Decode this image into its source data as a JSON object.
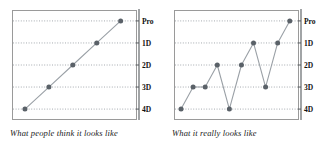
{
  "figure": {
    "panels": [
      {
        "id": "expected",
        "caption": "What people think it looks like",
        "chart_data": {
          "type": "line",
          "title": "What people think it looks like",
          "xlabel": "",
          "ylabel": "",
          "categories": [
            "1",
            "2",
            "3",
            "4",
            "5"
          ],
          "x": [
            1,
            2,
            3,
            4,
            5
          ],
          "values": [
            "4D",
            "3D",
            "2D",
            "1D",
            "Pro"
          ],
          "numeric_values": [
            0,
            1,
            2,
            3,
            4
          ],
          "ytick_labels": [
            "4D",
            "3D",
            "2D",
            "1D",
            "Pro"
          ],
          "ylim": [
            -0.45,
            4.45
          ],
          "xlim": [
            0.5,
            5.6
          ],
          "grid": true,
          "grid_style": "dotted-horizontal",
          "legend": "none",
          "marker": "circle",
          "marker_color": "#5a6168",
          "line_color": "#9aa0a6"
        }
      },
      {
        "id": "reality",
        "caption": "What it really looks like",
        "chart_data": {
          "type": "line",
          "title": "What it really looks like",
          "xlabel": "",
          "ylabel": "",
          "categories": [
            "1",
            "2",
            "3",
            "4",
            "5",
            "6",
            "7",
            "8",
            "9",
            "10"
          ],
          "x": [
            1,
            2,
            3,
            4,
            5,
            6,
            7,
            8,
            9,
            10
          ],
          "values": [
            "4D",
            "3D",
            "3D",
            "2D",
            "4D",
            "2D",
            "1D",
            "3D",
            "1D",
            "Pro"
          ],
          "numeric_values": [
            0,
            1,
            1,
            2,
            0,
            2,
            3,
            1,
            3,
            4
          ],
          "ytick_labels": [
            "4D",
            "3D",
            "2D",
            "1D",
            "Pro"
          ],
          "ylim": [
            -0.45,
            4.45
          ],
          "xlim": [
            0.5,
            10.6
          ],
          "grid": true,
          "grid_style": "dotted-horizontal",
          "legend": "none",
          "marker": "circle",
          "marker_color": "#5a6168",
          "line_color": "#9aa0a6"
        }
      }
    ],
    "axis_labels_top_to_bottom": [
      "Pro",
      "1D",
      "2D",
      "3D",
      "4D"
    ],
    "colors": {
      "marker": "#5a6168",
      "line": "#9aa0a6",
      "grid": "#8f969c",
      "frame": "#9a9a9a",
      "axis": "#55595d",
      "text": "#111111",
      "background": "#ffffff"
    }
  }
}
